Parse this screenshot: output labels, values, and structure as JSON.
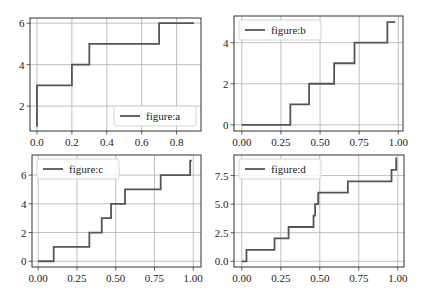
{
  "chart_data": [
    {
      "id": "a",
      "type": "line",
      "drawstyle": "steps-post",
      "legend": "figure:a",
      "legend_position": "lower right",
      "x": [
        0.0,
        0.0,
        0.2,
        0.3,
        0.7,
        0.9
      ],
      "y": [
        1,
        3,
        4,
        5,
        6,
        6
      ],
      "xticks": [
        0.0,
        0.2,
        0.4,
        0.6,
        0.8
      ],
      "xtick_labels": [
        "0.0",
        "0.2",
        "0.4",
        "0.6",
        "0.8"
      ],
      "yticks": [
        2,
        4,
        6
      ],
      "ytick_labels": [
        "2",
        "4",
        "6"
      ],
      "xlim": [
        -0.04,
        0.94
      ],
      "ylim": [
        0.8,
        6.25
      ],
      "grid": true,
      "box": {
        "left": 30,
        "top": 18,
        "right": 201,
        "bottom": 131
      }
    },
    {
      "id": "b",
      "type": "line",
      "drawstyle": "steps-post",
      "legend": "figure:b",
      "legend_position": "upper left",
      "x": [
        0.0,
        0.31,
        0.43,
        0.59,
        0.72,
        0.93,
        0.98
      ],
      "y": [
        0,
        1,
        2,
        3,
        4,
        5,
        5
      ],
      "xticks": [
        0.0,
        0.25,
        0.5,
        0.75,
        1.0
      ],
      "xtick_labels": [
        "0.00",
        "0.25",
        "0.50",
        "0.75",
        "1.00"
      ],
      "yticks": [
        0,
        2,
        4
      ],
      "ytick_labels": [
        "0",
        "2",
        "4"
      ],
      "xlim": [
        -0.05,
        1.03
      ],
      "ylim": [
        -0.3,
        5.3
      ],
      "grid": true,
      "box": {
        "left": 234,
        "top": 16,
        "right": 403,
        "bottom": 131
      }
    },
    {
      "id": "c",
      "type": "line",
      "drawstyle": "steps-post",
      "legend": "figure:c",
      "legend_position": "upper left",
      "x": [
        0.0,
        0.1,
        0.33,
        0.41,
        0.47,
        0.56,
        0.79,
        0.98,
        0.99
      ],
      "y": [
        0,
        1,
        2,
        3,
        4,
        5,
        6,
        7,
        7
      ],
      "xticks": [
        0.0,
        0.25,
        0.5,
        0.75,
        1.0
      ],
      "xtick_labels": [
        "0.00",
        "0.25",
        "0.50",
        "0.75",
        "1.00"
      ],
      "yticks": [
        0,
        2,
        4,
        6
      ],
      "ytick_labels": [
        "0",
        "2",
        "4",
        "6"
      ],
      "xlim": [
        -0.04,
        1.05
      ],
      "ylim": [
        -0.4,
        7.4
      ],
      "grid": true,
      "box": {
        "left": 32,
        "top": 155,
        "right": 201,
        "bottom": 267
      }
    },
    {
      "id": "d",
      "type": "line",
      "drawstyle": "steps-post",
      "legend": "figure:d",
      "legend_position": "upper left",
      "x": [
        0.0,
        0.03,
        0.21,
        0.3,
        0.46,
        0.47,
        0.49,
        0.68,
        0.96,
        0.99,
        0.995
      ],
      "y": [
        0,
        1,
        2,
        3,
        4,
        5,
        6,
        7,
        8,
        9,
        9
      ],
      "xticks": [
        0.0,
        0.25,
        0.5,
        0.75,
        1.0
      ],
      "xtick_labels": [
        "0.00",
        "0.25",
        "0.50",
        "0.75",
        "1.00"
      ],
      "yticks": [
        0.0,
        2.5,
        5.0,
        7.5
      ],
      "ytick_labels": [
        "0.0",
        "2.5",
        "5.0",
        "7.5"
      ],
      "xlim": [
        -0.05,
        1.04
      ],
      "ylim": [
        -0.5,
        9.3
      ],
      "grid": true,
      "box": {
        "left": 234,
        "top": 155,
        "right": 404,
        "bottom": 267
      }
    }
  ],
  "colors": {
    "line": "#555555",
    "grid": "#b0b0b0",
    "axes": "#333333",
    "legend_border": "#cccccc"
  }
}
